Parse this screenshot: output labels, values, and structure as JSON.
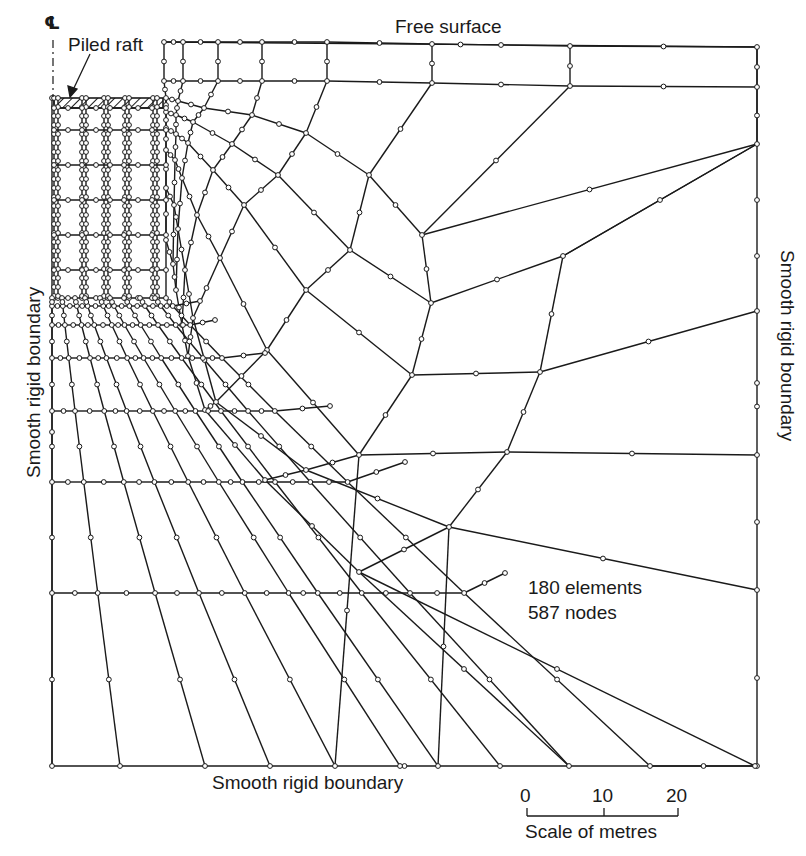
{
  "figure": {
    "title_labels": {
      "free_surface": "Free surface",
      "piled_raft": "Piled raft",
      "left_boundary": "Smooth rigid boundary",
      "right_boundary": "Smooth rigid boundary",
      "bottom_boundary": "Smooth rigid boundary",
      "centerline_symbol": "℄"
    },
    "mesh_info": {
      "elements": "180 elements",
      "nodes": "587 nodes"
    },
    "scale_bar": {
      "ticks": [
        "0",
        "10",
        "20"
      ],
      "label": "Scale of metres",
      "unit": "metres"
    },
    "colors": {
      "line": "#1a1a1a",
      "node_fill": "#ffffff",
      "background": "#ffffff"
    }
  },
  "mesh": {
    "boundary": {
      "left": 52,
      "right": 757,
      "top": 42,
      "bottom": 766,
      "inner_left": 164
    },
    "raft": {
      "x0": 54,
      "x1": 163,
      "y0": 98,
      "y1": 108
    },
    "piles_x": [
      56,
      84,
      106,
      127,
      155
    ],
    "pile_base_y": 298,
    "block_rows_y": [
      108,
      130,
      165,
      200,
      235,
      270,
      298
    ],
    "grid": [
      [
        [
          164,
          42
        ],
        [
          183,
          42
        ],
        [
          218,
          42
        ],
        [
          262,
          42
        ],
        [
          327,
          42
        ],
        [
          432,
          44
        ],
        [
          570,
          46
        ],
        [
          757,
          47
        ]
      ],
      [
        [
          164,
          81
        ],
        [
          183,
          81
        ],
        [
          218,
          81
        ],
        [
          262,
          81
        ],
        [
          327,
          81
        ],
        [
          432,
          83
        ],
        [
          570,
          86
        ],
        [
          757,
          87
        ]
      ],
      [
        [
          166,
          98
        ],
        [
          178,
          101
        ],
        [
          204,
          108
        ],
        [
          252,
          115
        ],
        [
          306,
          133
        ],
        [
          369,
          175
        ],
        [
          422,
          235
        ],
        [
          757,
          144
        ]
      ],
      [
        [
          166,
          112
        ],
        [
          176,
          115
        ],
        [
          193,
          122
        ],
        [
          232,
          144
        ],
        [
          278,
          175
        ],
        [
          350,
          250
        ],
        [
          431,
          303
        ],
        [
          563,
          256
        ]
      ],
      [
        [
          166,
          128
        ],
        [
          176,
          134
        ],
        [
          188,
          143
        ],
        [
          213,
          170
        ],
        [
          244,
          205
        ],
        [
          306,
          290
        ],
        [
          412,
          375
        ],
        [
          540,
          372
        ]
      ],
      [
        [
          166,
          150
        ],
        [
          175,
          160
        ],
        [
          182,
          178
        ],
        [
          197,
          215
        ],
        [
          220,
          258
        ],
        [
          267,
          350
        ],
        [
          359,
          455
        ],
        [
          507,
          452
        ]
      ],
      [
        [
          166,
          188
        ],
        [
          174,
          205
        ],
        [
          178,
          229
        ],
        [
          185,
          270
        ],
        [
          193,
          318
        ],
        [
          216,
          402
        ],
        [
          306,
          470
        ],
        [
          449,
          527
        ]
      ],
      [
        [
          166,
          240
        ],
        [
          173,
          264
        ],
        [
          176,
          290
        ],
        [
          182,
          325
        ],
        [
          188,
          356
        ],
        [
          205,
          410
        ],
        [
          265,
          480
        ],
        [
          359,
          572
        ]
      ]
    ],
    "rays_extra": [
      {
        "from": [
          757,
          144
        ],
        "to": [
          757,
          144
        ]
      },
      {
        "from": [
          563,
          256
        ],
        "to": [
          757,
          144
        ]
      },
      {
        "from": [
          540,
          372
        ],
        "to": [
          757,
          311
        ]
      },
      {
        "from": [
          507,
          452
        ],
        "to": [
          757,
          455
        ]
      },
      {
        "from": [
          449,
          527
        ],
        "to": [
          757,
          590
        ]
      },
      {
        "from": [
          359,
          572
        ],
        "to": [
          755,
          766
        ]
      }
    ],
    "left_rows_y": [
      306,
      325,
      358,
      411,
      482,
      593,
      766
    ],
    "left_cols_x": [
      52,
      62,
      75,
      85,
      100,
      110,
      125,
      140,
      160,
      185
    ],
    "bottom_nodes_x": [
      52,
      120,
      205,
      335,
      438,
      569,
      755
    ]
  }
}
